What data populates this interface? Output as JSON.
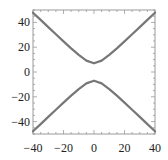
{
  "chart_data": {
    "type": "line",
    "title": "",
    "xlabel": "",
    "ylabel": "",
    "xlim": [
      -40,
      40
    ],
    "ylim": [
      -50,
      50
    ],
    "grid": false,
    "legend": null,
    "x_ticks": [
      -40,
      -20,
      0,
      20,
      40
    ],
    "x_tick_labels": [
      "−40",
      "−20",
      "0",
      "20",
      "40"
    ],
    "y_ticks": [
      -40,
      -20,
      0,
      20,
      40
    ],
    "y_tick_labels": [
      "−40",
      "−20",
      "0",
      "20",
      "40"
    ],
    "series": [
      {
        "name": "upper branch",
        "color": "#777777",
        "x": [
          -40,
          -35,
          -30,
          -25,
          -20,
          -15,
          -10,
          -5,
          0,
          5,
          10,
          15,
          20,
          25,
          30,
          35,
          40
        ],
        "y": [
          47.8,
          42.0,
          36.2,
          30.4,
          24.7,
          19.1,
          13.8,
          9.2,
          7.0,
          9.2,
          13.8,
          19.1,
          24.7,
          30.4,
          36.2,
          42.0,
          47.8
        ]
      },
      {
        "name": "lower branch",
        "color": "#777777",
        "x": [
          -40,
          -35,
          -30,
          -25,
          -20,
          -15,
          -10,
          -5,
          0,
          5,
          10,
          15,
          20,
          25,
          30,
          35,
          40
        ],
        "y": [
          -47.8,
          -42.0,
          -36.2,
          -30.4,
          -24.7,
          -19.1,
          -13.8,
          -9.2,
          -7.0,
          -9.2,
          -13.8,
          -19.1,
          -24.7,
          -30.4,
          -36.2,
          -42.0,
          -47.8
        ]
      }
    ]
  },
  "style": {
    "curve_color": "#777777",
    "frame_color": "#999999",
    "tick_color": "#999999"
  }
}
